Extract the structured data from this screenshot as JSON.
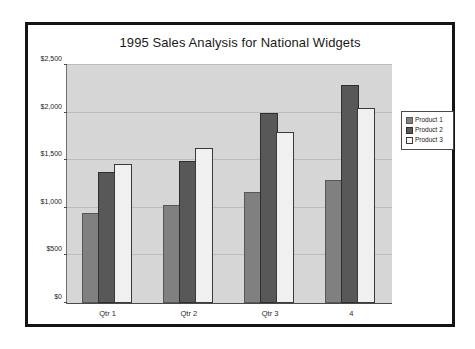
{
  "slide": {
    "title": "1995 Sales Analysis for National Widgets"
  },
  "legend": {
    "position": "right",
    "entries": [
      {
        "label": "Product 1",
        "swatch": "legend-swatch-product-1",
        "color": "#808080"
      },
      {
        "label": "Product 2",
        "swatch": "legend-swatch-product-2",
        "color": "#585858"
      },
      {
        "label": "Product 3",
        "swatch": "legend-swatch-product-3",
        "color": "#f0f0f0"
      }
    ]
  },
  "colors": {
    "plot_background": "#d6d6d6",
    "slide_border": "#141414",
    "gridline": "#bcbcbc",
    "axis": "#4a4a4a",
    "text": "#1a1a1a"
  },
  "chart_data": {
    "type": "bar",
    "title": "1995 Sales Analysis for National Widgets",
    "xlabel": "",
    "ylabel": "",
    "categories": [
      "Qtr 1",
      "Qtr 2",
      "Qtr 3",
      "4"
    ],
    "series": [
      {
        "name": "Product 1",
        "color": "#808080",
        "values": [
          920,
          1010,
          1140,
          1270
        ]
      },
      {
        "name": "Product 2",
        "color": "#585858",
        "values": [
          1360,
          1470,
          1980,
          2270
        ]
      },
      {
        "name": "Product 3",
        "color": "#f0f0f0",
        "values": [
          1440,
          1610,
          1780,
          2030
        ]
      }
    ],
    "ylim": [
      0,
      2500
    ],
    "yticks": [
      0,
      500,
      1000,
      1500,
      2000,
      2500
    ],
    "ytick_labels": [
      "$0",
      "$500",
      "$1,000",
      "$1,500",
      "$2,000",
      "$2,500"
    ],
    "grid": true,
    "grid_axis": "y",
    "legend_position": "right",
    "bar_group_gap": true
  }
}
